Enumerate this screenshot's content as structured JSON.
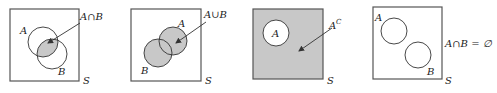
{
  "figure": {
    "colors": {
      "shade": "#c8c8c8",
      "stroke": "#333333",
      "background": "#ffffff"
    },
    "panels": [
      {
        "id": "intersection",
        "universe_label": "S",
        "set_labels": [
          "A",
          "B"
        ],
        "annotation": "A∩B",
        "shaded_region": "intersection of A and B"
      },
      {
        "id": "union",
        "universe_label": "S",
        "set_labels": [
          "A",
          "B"
        ],
        "annotation": "A∪B",
        "shaded_region": "union of A and B"
      },
      {
        "id": "complement",
        "universe_label": "S",
        "set_labels": [
          "A"
        ],
        "annotation": "Aᶜ",
        "annotation_base": "A",
        "annotation_sup": "C",
        "shaded_region": "complement of A"
      },
      {
        "id": "disjoint",
        "universe_label": "S",
        "set_labels": [
          "A",
          "B"
        ],
        "annotation": "A∩B = ∅",
        "shaded_region": "none"
      }
    ]
  }
}
